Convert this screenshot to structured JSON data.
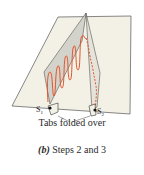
{
  "figure": {
    "labels": {
      "s1": "S",
      "s1_sub": "1",
      "s2": "S",
      "s2_sub": "2",
      "tabs": "Tabs folded over"
    },
    "caption": {
      "part": "(b)",
      "text": " Steps 2 and 3"
    },
    "colors": {
      "paper": "#f3f1e6",
      "fold_panel": "#d4d3cb",
      "wave": "#e0542a",
      "outline": "#555555"
    }
  }
}
